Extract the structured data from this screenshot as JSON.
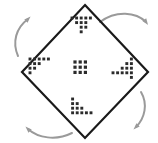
{
  "figure": {
    "background_color": "#ffffff",
    "outline_color": "#1a1a1a",
    "dot_color": "#2b2b2b",
    "arrow_color": "#9a9a9a",
    "canvas": {
      "width": 158,
      "height": 143
    }
  },
  "shape": {
    "name": "diamond",
    "sides": 4,
    "stroke_width": 2.2,
    "vertices": [
      {
        "label": "top",
        "x": 85,
        "y": 5
      },
      {
        "label": "right",
        "x": 148,
        "y": 72
      },
      {
        "label": "bottom",
        "x": 85,
        "y": 138
      },
      {
        "label": "left",
        "x": 22,
        "y": 72
      }
    ]
  },
  "center_motif": {
    "name": "center-dot-block",
    "rows": 3,
    "cols": 3,
    "dot_count": 9,
    "dot_size": 3.2,
    "spacing": 5.2,
    "origin": {
      "x": 75,
      "y": 62
    }
  },
  "corner_motifs": [
    {
      "name": "motif-top",
      "position": "top",
      "rotation_deg": 0,
      "dot_count": 12,
      "origin": {
        "x": 72,
        "y": 18
      },
      "spacing": 4.6,
      "dot_size": 2.9,
      "cells": [
        [
          0,
          0
        ],
        [
          1,
          0
        ],
        [
          2,
          0
        ],
        [
          3,
          0
        ],
        [
          4,
          0
        ],
        [
          1,
          1
        ],
        [
          2,
          1
        ],
        [
          3,
          1
        ],
        [
          2,
          2
        ],
        [
          3,
          2
        ],
        [
          2,
          3
        ]
      ]
    },
    {
      "name": "motif-right",
      "position": "right",
      "rotation_deg": 90,
      "dot_count": 12,
      "origin": {
        "x": 113,
        "y": 59
      },
      "spacing": 4.6,
      "dot_size": 2.9,
      "cells": [
        [
          4,
          0
        ],
        [
          4,
          1
        ],
        [
          4,
          2
        ],
        [
          4,
          3
        ],
        [
          4,
          4
        ],
        [
          3,
          1
        ],
        [
          3,
          2
        ],
        [
          3,
          3
        ],
        [
          2,
          2
        ],
        [
          2,
          3
        ],
        [
          1,
          3
        ],
        [
          0,
          3
        ]
      ]
    },
    {
      "name": "motif-bottom",
      "position": "bottom",
      "rotation_deg": 180,
      "dot_count": 12,
      "origin": {
        "x": 68,
        "y": 99
      },
      "spacing": 4.6,
      "dot_size": 2.9,
      "cells": [
        [
          1,
          0
        ],
        [
          1,
          1
        ],
        [
          2,
          1
        ],
        [
          1,
          2
        ],
        [
          2,
          2
        ],
        [
          3,
          2
        ],
        [
          1,
          3
        ],
        [
          2,
          3
        ],
        [
          3,
          3
        ],
        [
          4,
          3
        ],
        [
          5,
          3
        ]
      ]
    },
    {
      "name": "motif-left",
      "position": "left",
      "rotation_deg": 270,
      "dot_count": 12,
      "origin": {
        "x": 30,
        "y": 59
      },
      "spacing": 4.6,
      "dot_size": 2.9,
      "cells": [
        [
          0,
          0
        ],
        [
          1,
          0
        ],
        [
          2,
          0
        ],
        [
          3,
          0
        ],
        [
          4,
          0
        ],
        [
          0,
          1
        ],
        [
          1,
          1
        ],
        [
          2,
          1
        ],
        [
          0,
          2
        ],
        [
          1,
          2
        ],
        [
          0,
          3
        ]
      ]
    }
  ],
  "rotation_arrows": [
    {
      "name": "arrow-top-right",
      "position": "top-right",
      "direction": "clockwise",
      "points_toward": "right",
      "path": "M 100 22 C 116 10, 136 12, 146 22",
      "head": {
        "x": 146,
        "y": 22,
        "angle_deg": 55
      }
    },
    {
      "name": "arrow-bottom-right",
      "position": "bottom-right",
      "direction": "clockwise",
      "points_toward": "down",
      "path": "M 141 92 C 148 104, 145 118, 136 127",
      "head": {
        "x": 136,
        "y": 127,
        "angle_deg": 135
      }
    },
    {
      "name": "arrow-bottom-left",
      "position": "bottom-left",
      "direction": "clockwise",
      "points_toward": "left",
      "path": "M 72 133 C 56 141, 38 138, 28 129",
      "head": {
        "x": 28,
        "y": 129,
        "angle_deg": 225
      }
    },
    {
      "name": "arrow-top-left",
      "position": "top-left",
      "direction": "clockwise",
      "points_toward": "up",
      "path": "M 18 56 C 12 42, 16 28, 28 19",
      "head": {
        "x": 28,
        "y": 19,
        "angle_deg": 315
      }
    }
  ]
}
